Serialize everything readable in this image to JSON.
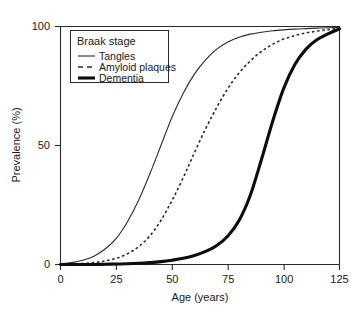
{
  "chart_data": {
    "type": "line",
    "title": "",
    "xlabel": "Age (years)",
    "ylabel": "Prevalence (%)",
    "xlim": [
      0,
      125
    ],
    "ylim": [
      0,
      100
    ],
    "xticks": [
      0,
      25,
      50,
      75,
      100,
      125
    ],
    "yticks": [
      0,
      50,
      100
    ],
    "xtick_labels": [
      "0",
      "25",
      "50",
      "75",
      "100",
      "125"
    ],
    "ytick_labels": [
      "0",
      "50",
      "100"
    ],
    "grid": false,
    "legend_position": "upper-left",
    "legend_title": "Braak stage",
    "x": [
      0,
      5,
      10,
      15,
      20,
      25,
      30,
      35,
      40,
      45,
      50,
      55,
      60,
      65,
      70,
      75,
      80,
      85,
      90,
      95,
      100,
      105,
      110,
      115,
      120,
      125
    ],
    "series": [
      {
        "name": "Tangles",
        "style": "solid-thin",
        "midpoint_age": 45,
        "values": [
          0.3,
          0.8,
          1.8,
          3.5,
          6.5,
          11.0,
          18.0,
          27.0,
          38.0,
          50.0,
          62.0,
          72.0,
          80.0,
          86.0,
          90.5,
          93.5,
          95.5,
          96.8,
          97.6,
          98.2,
          98.6,
          98.9,
          99.1,
          99.3,
          99.5,
          99.6
        ]
      },
      {
        "name": "Amyloid plaques",
        "style": "dashed",
        "midpoint_age": 69,
        "values": [
          0.1,
          0.2,
          0.4,
          0.8,
          1.5,
          2.6,
          4.5,
          7.5,
          12.0,
          18.5,
          27.0,
          36.5,
          47.0,
          57.0,
          66.0,
          74.0,
          80.5,
          85.5,
          89.5,
          92.5,
          94.7,
          96.2,
          97.3,
          98.1,
          98.7,
          99.2
        ]
      },
      {
        "name": "Dementia",
        "style": "solid-thick",
        "midpoint_age": 91,
        "values": [
          0.0,
          0.0,
          0.0,
          0.0,
          0.1,
          0.2,
          0.3,
          0.5,
          0.8,
          1.2,
          1.8,
          2.6,
          3.8,
          5.5,
          8.0,
          12.0,
          18.5,
          29.0,
          44.0,
          60.0,
          74.0,
          84.0,
          90.5,
          94.5,
          97.0,
          99.0
        ]
      }
    ]
  },
  "axes": {
    "x_title": "Age (years)",
    "y_title": "Prevalence (%)"
  },
  "legend": {
    "title": "Braak stage",
    "items": [
      {
        "label": "Tangles"
      },
      {
        "label": "Amyloid plaques"
      },
      {
        "label": "Dementia"
      }
    ]
  },
  "colors": {
    "axis": "#2b2b2b",
    "tangles": "#2b2b2b",
    "amyloid": "#2b2b2b",
    "dementia": "#0d0d0d",
    "background": "#ffffff"
  }
}
